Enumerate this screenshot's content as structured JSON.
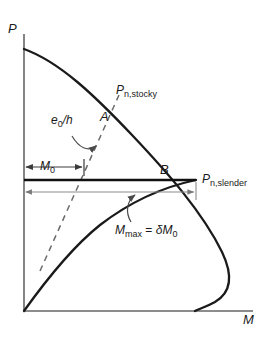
{
  "figure": {
    "type": "engineering-diagram",
    "axes": {
      "y_label": "P",
      "x_label": "M",
      "y_axis_name": "axial-load-axis",
      "x_axis_name": "bending-moment-axis"
    },
    "points": [
      {
        "key": "A",
        "label": "A",
        "name": "point-a"
      },
      {
        "key": "B",
        "label": "B",
        "name": "point-b"
      }
    ],
    "curves": [
      {
        "key": "stocky",
        "label_main": "P",
        "label_sub": "n,stocky",
        "name": "stocky-interaction-curve"
      },
      {
        "key": "slender",
        "label_main": "P",
        "label_sub": "n,slender",
        "name": "slender-interaction-curve"
      }
    ],
    "annotations": [
      {
        "key": "eccentricity_ratio",
        "main": "e",
        "sub": "0",
        "tail": "/h",
        "name": "eccentricity-ratio-label"
      },
      {
        "key": "m0",
        "main": "M",
        "sub": "0",
        "name": "m-zero-label"
      },
      {
        "key": "mmax",
        "text_part1": "M",
        "sub1": "max",
        "text_part2": " = ",
        "delta": "δ",
        "text_part3": "M",
        "sub2": "0",
        "name": "m-max-label"
      }
    ],
    "colors": {
      "curve": "#1a1a1a",
      "axis": "#555555",
      "thin_line": "#8c8c8c",
      "dashed": "#6b6b6b",
      "text": "#1a1a1a",
      "background": "#ffffff"
    }
  }
}
